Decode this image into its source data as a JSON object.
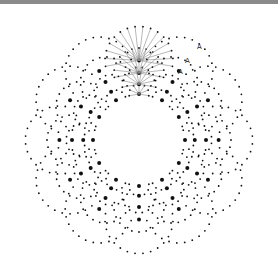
{
  "diagram": {
    "title": "",
    "center": [
      139,
      140
    ],
    "group_count": 12,
    "group_start_angle_deg": -90,
    "arc_inner_offset": 10,
    "arc_centers_distance": [
      52,
      66,
      82,
      100
    ],
    "arc_radii": [
      10,
      17,
      25,
      34
    ],
    "arc_span_deg": 200,
    "dot_color": "#111111",
    "line_color": "#888888",
    "highlighted_group": 0,
    "labels": [
      {
        "text": "A",
        "x": 197,
        "y": 49
      },
      {
        "text": "A",
        "x": 185,
        "y": 63
      },
      {
        "text": "A",
        "x": 178,
        "y": 74
      }
    ]
  }
}
